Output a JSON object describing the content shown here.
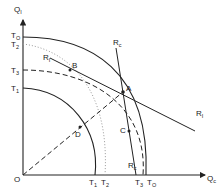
{
  "diagram": {
    "axes": {
      "y_label": "Q",
      "y_sub": "I",
      "x_label": "Q",
      "x_sub": "c",
      "origin": "O"
    },
    "y_ticks": [
      {
        "label": "T",
        "sub": "O"
      },
      {
        "label": "T",
        "sub": "2"
      },
      {
        "label": "T",
        "sub": "3"
      },
      {
        "label": "T",
        "sub": "1"
      }
    ],
    "x_ticks": [
      {
        "label": "T",
        "sub": "1"
      },
      {
        "label": "T",
        "sub": "2"
      },
      {
        "label": "T",
        "sub": "3"
      },
      {
        "label": "T",
        "sub": "O"
      }
    ],
    "points": {
      "A": "A",
      "B": "B",
      "C": "C",
      "D": "D"
    },
    "lines": {
      "Rc_top": {
        "label": "R",
        "sub": "c"
      },
      "Rc_bottom": {
        "label": "R",
        "sub": "c"
      },
      "RI_left": {
        "label": "R",
        "sub": "I"
      },
      "RI_right": {
        "label": "R",
        "sub": "I"
      }
    },
    "colors": {
      "ink": "#222222",
      "dotted": "#888888"
    }
  }
}
